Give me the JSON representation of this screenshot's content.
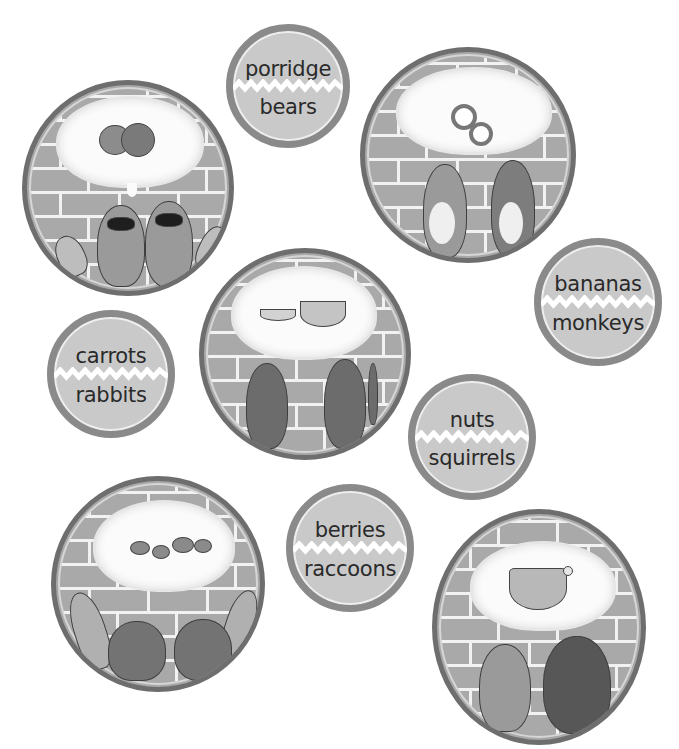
{
  "activity": {
    "type": "matching",
    "description": "Match each food to the animals thinking about it"
  },
  "word_circles": [
    {
      "id": "porridge-bears",
      "food": "porridge",
      "animal": "bears"
    },
    {
      "id": "bananas-monkeys",
      "food": "bananas",
      "animal": "monkeys"
    },
    {
      "id": "carrots-rabbits",
      "food": "carrots",
      "animal": "rabbits"
    },
    {
      "id": "nuts-squirrels",
      "food": "nuts",
      "animal": "squirrels"
    },
    {
      "id": "berries-raccoons",
      "food": "berries",
      "animal": "raccoons"
    }
  ],
  "picture_circles": [
    {
      "id": "raccoons-picture",
      "animals": "two raccoons",
      "thought": "berries"
    },
    {
      "id": "rabbits-picture",
      "animals": "two rabbits",
      "thought": "carrots"
    },
    {
      "id": "monkeys-picture",
      "animals": "two monkeys",
      "thought": "bananas"
    },
    {
      "id": "squirrels-picture",
      "animals": "two squirrels",
      "thought": "nuts"
    },
    {
      "id": "bears-picture",
      "animals": "two bears",
      "thought": "porridge"
    }
  ],
  "colors": {
    "background": "#ffffff",
    "ring": "#8a8a8a",
    "word_fill": "#c9c9c9",
    "brick": "#a9a9a9",
    "mortar": "#f2f2f2",
    "text": "#2a2a2a"
  }
}
